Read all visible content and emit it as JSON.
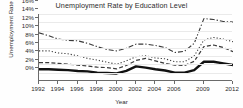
{
  "chart_data": {
    "type": "line",
    "title": "Unemployment Rate by Education Level",
    "xlabel": "Year",
    "ylabel": "Unemployment Rate",
    "grid": true,
    "legend": "none",
    "ylim": [
      0,
      16
    ],
    "xlim": [
      1992,
      2012
    ],
    "ytick_labels": [
      "0%",
      "2%",
      "4%",
      "6%",
      "8%",
      "10%",
      "12%",
      "14%",
      "16%"
    ],
    "ytick_values": [
      0,
      2,
      4,
      6,
      8,
      10,
      12,
      14,
      16
    ],
    "xtick_labels": [
      "1992",
      "1994",
      "1996",
      "1998",
      "2000",
      "2002",
      "2004",
      "2006",
      "2009",
      "2012"
    ],
    "xtick_values": [
      1992,
      1994,
      1996,
      1998,
      2000,
      2002,
      2004,
      2006,
      2009,
      2012
    ],
    "x": [
      1992,
      1993,
      1994,
      1995,
      1996,
      1997,
      1998,
      1999,
      2000,
      2001,
      2002,
      2003,
      2004,
      2005,
      2006,
      2007,
      2008,
      2009,
      2010,
      2011,
      2012
    ],
    "series": [
      {
        "name": "Less than high school diploma",
        "style": "dash-dot",
        "color": "#3a3a3a",
        "width": 1.1,
        "values": [
          11.5,
          10.8,
          10.0,
          9.7,
          9.6,
          9.0,
          8.2,
          7.5,
          7.2,
          7.8,
          8.8,
          8.8,
          8.5,
          8.0,
          6.8,
          7.1,
          9.0,
          14.9,
          14.7,
          14.2,
          14.1
        ]
      },
      {
        "name": "High school graduate, no college",
        "style": "dotted",
        "color": "#3a3a3a",
        "width": 1.1,
        "values": [
          7.2,
          7.2,
          6.7,
          6.5,
          6.0,
          5.4,
          5.0,
          4.5,
          4.0,
          4.8,
          5.8,
          6.0,
          5.5,
          5.3,
          4.6,
          4.6,
          6.0,
          9.8,
          10.4,
          10.0,
          9.4
        ]
      },
      {
        "name": "Some college or associate degree",
        "style": "dashed",
        "color": "#3a3a3a",
        "width": 1.2,
        "values": [
          4.4,
          4.4,
          4.2,
          4.0,
          3.8,
          3.6,
          3.3,
          3.2,
          2.9,
          3.7,
          4.9,
          5.4,
          4.8,
          4.2,
          3.8,
          3.7,
          4.7,
          8.2,
          8.6,
          8.0,
          7.0
        ]
      },
      {
        "name": "Bachelor's degree and higher",
        "style": "solid",
        "color": "#111111",
        "width": 2.4,
        "values": [
          2.8,
          2.8,
          2.7,
          2.6,
          2.4,
          2.3,
          2.0,
          1.9,
          1.8,
          2.4,
          3.5,
          3.2,
          2.8,
          2.5,
          2.0,
          2.0,
          2.6,
          4.6,
          4.6,
          4.2,
          3.8
        ]
      }
    ]
  }
}
